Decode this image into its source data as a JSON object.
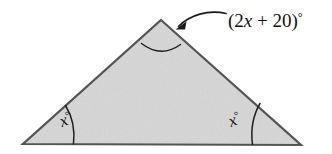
{
  "figure": {
    "kind": "isosceles-triangle-angle-diagram",
    "background_color": "#ffffff",
    "fill_color": "#d6d6d6",
    "stroke_color": "#545454",
    "text_color": "#141414",
    "vertices": {
      "apex": {
        "x": 161,
        "y": 20
      },
      "bottom_left": {
        "x": 23,
        "y": 144
      },
      "bottom_right": {
        "x": 301,
        "y": 145
      }
    },
    "labels": {
      "apex_expression_open": "(2",
      "apex_expression_var": "x",
      "apex_expression_middle": " + 20)",
      "apex_expression_degree": "°",
      "apex_full_text": "(2x + 20)°",
      "base_left_var": "x",
      "base_left_degree": "°",
      "base_left_full_text": "x°",
      "base_right_var": "x",
      "base_right_degree": "°",
      "base_right_full_text": "x°"
    },
    "annotations": {
      "arrow_name": "curved-arrow-to-apex-angle",
      "arc_apex_name": "apex-angle-arc",
      "arc_left_name": "left-base-angle-arc",
      "arc_right_name": "right-base-angle-arc"
    }
  }
}
